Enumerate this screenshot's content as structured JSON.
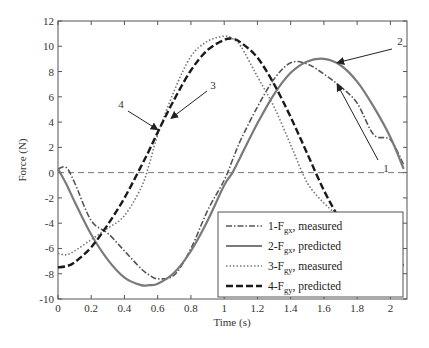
{
  "chart_data": {
    "type": "line",
    "title": "",
    "xlabel": "Time (s)",
    "ylabel": "Force (N)",
    "xlim": [
      0,
      2.1
    ],
    "ylim": [
      -10,
      12
    ],
    "xticks": [
      0,
      0.2,
      0.4,
      0.6,
      0.8,
      1,
      1.2,
      1.4,
      1.6,
      1.8,
      2
    ],
    "xtick_labels": [
      "0",
      "0.2",
      "0.4",
      "0.6",
      "0.8",
      "1",
      "1.2",
      "1.4",
      "1.6",
      "1.8",
      "2"
    ],
    "yticks": [
      -10,
      -8,
      -6,
      -4,
      -2,
      0,
      2,
      4,
      6,
      8,
      10,
      12
    ],
    "ytick_labels": [
      "-10",
      "-8",
      "-6",
      "-4",
      "-2",
      "0",
      "2",
      "4",
      "6",
      "8",
      "10",
      "12"
    ],
    "grid": false,
    "zero_line": true,
    "legend_position": "lower right",
    "x": [
      0,
      0.05,
      0.1,
      0.2,
      0.3,
      0.4,
      0.5,
      0.55,
      0.6,
      0.7,
      0.8,
      0.9,
      1.0,
      1.05,
      1.1,
      1.2,
      1.3,
      1.4,
      1.5,
      1.6,
      1.7,
      1.8,
      1.9,
      2.0,
      2.08
    ],
    "series": [
      {
        "name": "1-Fgx, measured",
        "label_main": "1-F",
        "label_sub": "gx",
        "label_rest": ", measured",
        "style": "dashdot",
        "color": "#555555",
        "values": [
          0.3,
          0.4,
          -0.8,
          -3.8,
          -4.8,
          -6.2,
          -7.6,
          -8.1,
          -8.4,
          -8.1,
          -6.0,
          -3.0,
          -0.6,
          1.0,
          2.6,
          5.2,
          7.4,
          8.7,
          8.6,
          7.8,
          6.8,
          5.5,
          3.0,
          2.6,
          0.6
        ]
      },
      {
        "name": "2-Fgx, predicted",
        "label_main": "2-F",
        "label_sub": "gx",
        "label_rest": ", predicted",
        "style": "solid",
        "color": "#7a7a7a",
        "values": [
          0.3,
          -0.9,
          -2.3,
          -4.9,
          -6.9,
          -8.3,
          -8.9,
          -8.9,
          -8.8,
          -7.9,
          -6.2,
          -3.8,
          -1.0,
          0.0,
          1.3,
          3.9,
          6.2,
          7.9,
          8.8,
          9.0,
          8.5,
          7.2,
          5.2,
          2.8,
          0.3
        ]
      },
      {
        "name": "3-Fgy, measured",
        "label_main": "3-F",
        "label_sub": "gy",
        "label_rest": ", measured",
        "style": "dotted",
        "color": "#777777",
        "values": [
          -6.4,
          -6.5,
          -6.2,
          -5.3,
          -4.4,
          -3.4,
          -1.2,
          0.7,
          3.0,
          6.5,
          9.2,
          10.4,
          10.8,
          10.6,
          10.0,
          7.6,
          5.2,
          2.2,
          -0.8,
          -2.4,
          -3.6,
          -5.0,
          -5.3,
          -5.7,
          -6.4
        ]
      },
      {
        "name": "4-Fgy, predicted",
        "label_main": "4-F",
        "label_sub": "gy",
        "label_rest": ", predicted",
        "style": "dashed",
        "color": "#1a1a1a",
        "values": [
          -7.5,
          -7.4,
          -7.1,
          -5.9,
          -4.1,
          -2.0,
          0.5,
          1.8,
          3.2,
          5.8,
          8.1,
          9.7,
          10.5,
          10.6,
          10.3,
          9.1,
          7.0,
          4.4,
          1.5,
          -1.4,
          -3.8,
          -5.8,
          -7.0,
          -7.4,
          -7.3
        ]
      }
    ],
    "annotations": [
      {
        "text": "1",
        "target_series": "1-Fgx, measured",
        "target_x": 1.68,
        "target_y": 7.0
      },
      {
        "text": "2",
        "target_series": "2-Fgx, predicted",
        "target_x": 1.68,
        "target_y": 8.7
      },
      {
        "text": "3",
        "target_series": "3-Fgy, measured",
        "target_x": 0.68,
        "target_y": 4.3
      },
      {
        "text": "4",
        "target_series": "4-Fgy, predicted",
        "target_x": 0.6,
        "target_y": 3.4
      }
    ]
  }
}
